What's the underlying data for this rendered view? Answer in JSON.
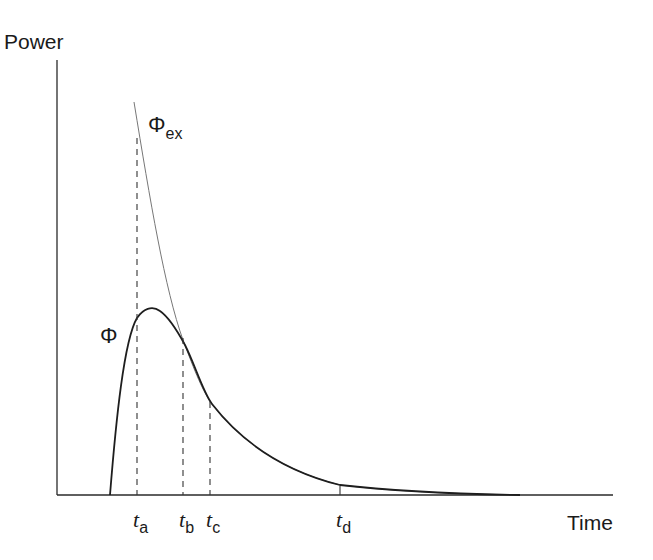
{
  "axes": {
    "y_label": "Power",
    "x_label": "Time"
  },
  "curves": {
    "phi": {
      "symbol": "Φ",
      "subscript": ""
    },
    "phi_ex": {
      "symbol": "Φ",
      "subscript": "ex"
    }
  },
  "time_marks": [
    {
      "t": "t",
      "sub": "a"
    },
    {
      "t": "t",
      "sub": "b"
    },
    {
      "t": "t",
      "sub": "c"
    },
    {
      "t": "t",
      "sub": "d"
    }
  ],
  "colors": {
    "axis": "#2a2a2a",
    "phi": "#1e1e1e",
    "phi_ex": "#777777",
    "dash": "#333333"
  }
}
